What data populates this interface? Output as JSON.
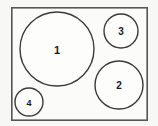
{
  "figure": {
    "type": "circle-packing-diagram",
    "background_color": "#f7f7f5",
    "frame": {
      "name": "bounding-rectangle",
      "x": 11,
      "y": 7,
      "width": 137,
      "height": 114,
      "fill": "#fbfbfa",
      "stroke": "#555555"
    },
    "stroke_color": "#3a3a3a",
    "label_color": "#1b1b1b",
    "circles": [
      {
        "label": "1",
        "cx": 57,
        "cy": 49,
        "r": 37,
        "size_class": "large"
      },
      {
        "label": "2",
        "cx": 119,
        "cy": 85,
        "r": 24,
        "size_class": "medium"
      },
      {
        "label": "3",
        "cx": 121,
        "cy": 31,
        "r": 17,
        "size_class": "small"
      },
      {
        "label": "4",
        "cx": 29,
        "cy": 102,
        "r": 14,
        "size_class": "smallest"
      }
    ]
  }
}
